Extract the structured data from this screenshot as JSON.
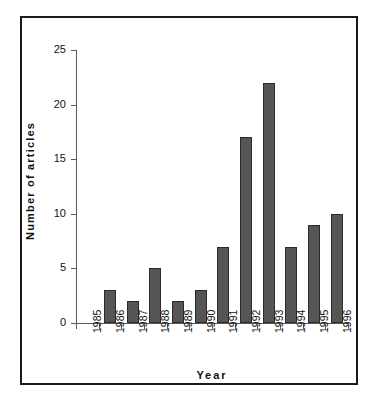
{
  "chart_data": {
    "type": "bar",
    "title": "",
    "xlabel": "Year",
    "ylabel": "Number  of  articles",
    "categories": [
      "1985",
      "1986",
      "1987",
      "1988",
      "1989",
      "1990",
      "1991",
      "1992",
      "1993",
      "1994",
      "1995",
      "1996"
    ],
    "values": [
      0,
      3,
      2,
      5,
      2,
      3,
      7,
      17,
      22,
      7,
      9,
      10
    ],
    "ylim": [
      0,
      25
    ],
    "yticks": [
      0,
      5,
      10,
      15,
      20,
      25
    ],
    "ytick_labels": [
      "0",
      "5",
      "10",
      "15",
      "20",
      "25"
    ],
    "grid": false,
    "legend": false,
    "bar_color": "#555555",
    "bar_edge_color": "#2b2b2b",
    "axis_color": "#5a5a5a",
    "frame_color": "#1a1a1a",
    "background": "#ffffff"
  }
}
